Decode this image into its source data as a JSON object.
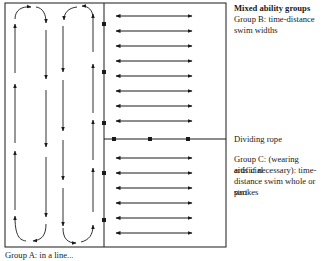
{
  "labels": {
    "group_b_heading": "Mixed ability groups",
    "group_b_desc_line1": "Group B: time-distance",
    "group_b_desc_line2": "swim widths",
    "dividing_rope": "Dividing rope",
    "group_c_line1": "Group C: (wearing artificial",
    "group_c_line2": "aids if necessary): time-",
    "group_c_line3": "distance swim whole or part",
    "group_c_line4": "strokes",
    "group_a_partial": "Group A: in a line..."
  },
  "colors": {
    "line": "#1a1a1a",
    "background": "#ffffff"
  },
  "diagram": {
    "pool": {
      "left": 5,
      "top": 3,
      "right": 226,
      "bottom": 247
    },
    "lane_divider_x": 104,
    "rope_y": 139,
    "group_b_arrow_rows": [
      12,
      27,
      42,
      57,
      72,
      87,
      102,
      117
    ],
    "group_c_arrow_rows": [
      157,
      172,
      187,
      202,
      217,
      232
    ],
    "divider_floats_y": [
      24,
      72,
      123,
      173,
      220
    ],
    "rope_floats_x": [
      114,
      150,
      188
    ]
  }
}
